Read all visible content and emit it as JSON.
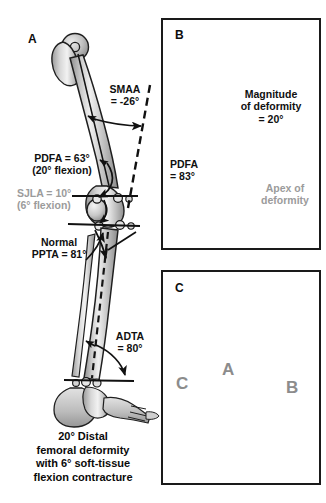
{
  "figure": {
    "background": "#ffffff",
    "colors": {
      "ink": "#101010",
      "gray_text": "#9b9b9b",
      "bone_light": "#dcdcdc",
      "bone_mid": "#b4b4b4",
      "bone_dark": "#7a7a7a",
      "frame": "#1a1a1a"
    }
  },
  "panels": [
    {
      "id": "A",
      "letter": "A",
      "name": "panel-a-full-limb",
      "labels": [
        {
          "name": "smaa-label",
          "lines": [
            "SMAA",
            "= -26°"
          ],
          "color": "black"
        },
        {
          "name": "pdfa-label",
          "lines": [
            "PDFA = 63°",
            "(20° flexion)"
          ],
          "color": "black"
        },
        {
          "name": "sjla-label",
          "lines": [
            "SJLA = 10°",
            "(6° flexion)"
          ],
          "color": "gray"
        },
        {
          "name": "ppta-label",
          "lines": [
            "Normal",
            "PPTA = 81°"
          ],
          "color": "black"
        },
        {
          "name": "adta-label",
          "lines": [
            "ADTA",
            "= 80°"
          ],
          "color": "black"
        }
      ],
      "caption": [
        "20° Distal",
        "femoral deformity",
        "with 6° soft-tissue",
        "flexion contracture"
      ]
    },
    {
      "id": "B",
      "letter": "B",
      "name": "panel-b-femur-deformity",
      "labels": [
        {
          "name": "magnitude-label",
          "lines": [
            "Magnitude",
            "of deformity",
            "= 20°"
          ],
          "color": "black"
        },
        {
          "name": "pdfa-b-label",
          "lines": [
            "PDFA",
            "= 83°"
          ],
          "color": "black"
        },
        {
          "name": "apex-label",
          "lines": [
            "Apex of",
            "deformity"
          ],
          "color": "gray"
        }
      ]
    },
    {
      "id": "C",
      "letter": "C",
      "name": "panel-c-distal-femur-fixation",
      "markers": [
        {
          "name": "marker-a",
          "label": "A"
        },
        {
          "name": "marker-b",
          "label": "B"
        },
        {
          "name": "marker-c",
          "label": "C"
        }
      ]
    }
  ],
  "measurements": {
    "SMAA": "-26°",
    "PDFA_panelA": "63°",
    "PDFA_panelA_flexion": "20°",
    "SJLA": "10°",
    "SJLA_flexion": "6°",
    "PPTA": "81°",
    "ADTA": "80°",
    "PDFA_panelB": "83°",
    "magnitude_of_deformity": "20°"
  }
}
